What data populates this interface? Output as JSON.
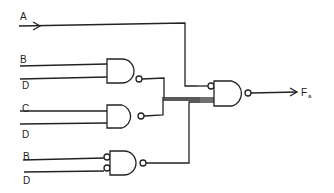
{
  "diagram": {
    "type": "logic-circuit",
    "inputs": [
      {
        "id": "A",
        "label": "A"
      },
      {
        "id": "B1",
        "label": "B"
      },
      {
        "id": "D1",
        "label": "D"
      },
      {
        "id": "C",
        "label": "C"
      },
      {
        "id": "D2",
        "label": "D"
      },
      {
        "id": "B2",
        "label": "B"
      },
      {
        "id": "D3",
        "label": "D"
      }
    ],
    "gates": [
      {
        "id": "g1",
        "type": "NAND",
        "inputs": [
          "B",
          "D"
        ]
      },
      {
        "id": "g2",
        "type": "NAND",
        "inputs": [
          "C",
          "D"
        ]
      },
      {
        "id": "g3",
        "type": "NAND",
        "inputs": [
          "B",
          "D"
        ],
        "inverted_inputs": true
      },
      {
        "id": "g4",
        "type": "NAND",
        "inputs": [
          "A",
          "g1",
          "g2",
          "g3"
        ],
        "first_input_inverted": true
      }
    ],
    "output": {
      "label": "F",
      "subscript": "a"
    }
  }
}
